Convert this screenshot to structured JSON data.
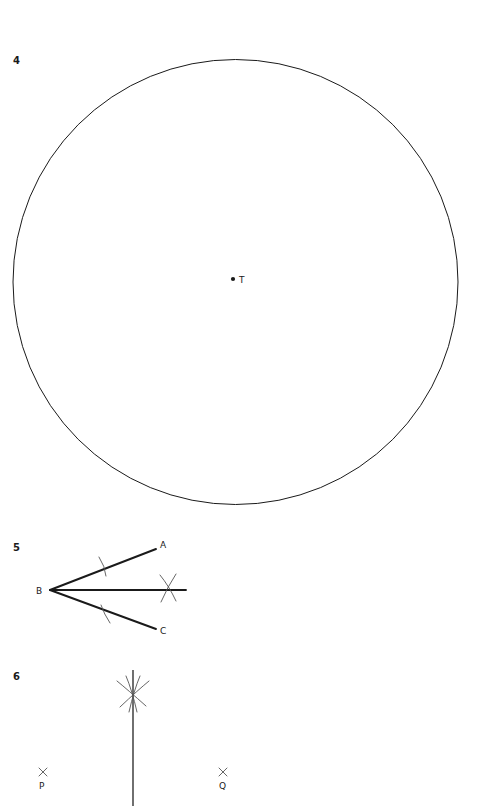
{
  "page": {
    "background": "#ffffff",
    "ink": "#1a1a1a",
    "construction_ink": "#555555",
    "width": 483,
    "height": 806
  },
  "problems": [
    {
      "number": "4",
      "name": "circle-with-center",
      "figure": "circle",
      "labels": {
        "center": "T"
      },
      "geometry": {
        "circle": {
          "cx": 235.5,
          "cy": 282,
          "r": 222.5
        },
        "center_dot": {
          "cx": 233,
          "cy": 279,
          "r": 2.1
        },
        "center_label_pos": {
          "x": 239,
          "y": 283
        }
      }
    },
    {
      "number": "5",
      "name": "angle-bisector-construction",
      "figure": "angle-bisector",
      "labels": {
        "vertex": "B",
        "upper_ray": "A",
        "lower_ray": "C"
      },
      "geometry": {
        "vertex": {
          "x": 50,
          "y": 590
        },
        "ray_a_end": {
          "x": 156,
          "y": 549
        },
        "ray_c_end": {
          "x": 156,
          "y": 629
        },
        "bisector_end": {
          "x": 186,
          "y": 590
        },
        "arc_tick_a": {
          "x": 103,
          "y": 566
        },
        "arc_tick_c": {
          "x": 105,
          "y": 614
        },
        "cross_arcs": {
          "x": 168,
          "y": 590
        },
        "label_a_pos": {
          "x": 160,
          "y": 548
        },
        "label_c_pos": {
          "x": 160,
          "y": 634
        },
        "label_b_pos": {
          "x": 36,
          "y": 594
        }
      }
    },
    {
      "number": "6",
      "name": "perpendicular-bisector-construction",
      "figure": "perpendicular-bisector",
      "labels": {
        "left_point": "P",
        "right_point": "Q"
      },
      "geometry": {
        "line_x": 133,
        "line_top_y": 670,
        "line_bottom_y": 806,
        "cross_arcs": {
          "x": 133,
          "y": 695
        },
        "point_p": {
          "x": 43,
          "y": 772
        },
        "point_q": {
          "x": 223,
          "y": 772
        },
        "label_p_pos": {
          "x": 43,
          "y": 789
        },
        "label_q_pos": {
          "x": 223,
          "y": 789
        }
      }
    }
  ]
}
